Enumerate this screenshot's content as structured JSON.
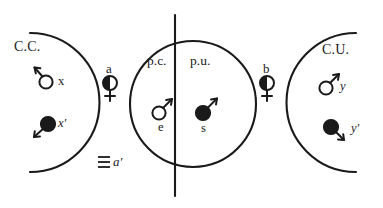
{
  "figure": {
    "background_color": "#ffffff",
    "ink_color": "#1a1a1a",
    "width": 383,
    "height": 208
  },
  "regions": {
    "left": {
      "name": "left-arc-region",
      "label": "C.C.",
      "shape": "open-arc-opening-left",
      "markers": [
        {
          "id": "x",
          "label": "x",
          "symbol": "mars-open",
          "fill": "open",
          "arrow_direction": "up-left"
        },
        {
          "id": "xp",
          "label": "x′",
          "symbol": "filled-disc-arrow",
          "fill": "filled",
          "arrow_direction": "down-left"
        }
      ]
    },
    "center": {
      "name": "center-circle-region",
      "shape": "full-circle-split-by-vertical-line",
      "left_half_label": "p.c.",
      "right_half_label": "p.u.",
      "markers": [
        {
          "id": "e",
          "label": "e",
          "symbol": "mars-open",
          "fill": "open",
          "arrow_direction": "up-right"
        },
        {
          "id": "s",
          "label": "s",
          "symbol": "mars-filled",
          "fill": "filled",
          "arrow_direction": "up-right"
        }
      ]
    },
    "right": {
      "name": "right-arc-region",
      "label": "C.U.",
      "shape": "open-arc-opening-right",
      "markers": [
        {
          "id": "y",
          "label": "y",
          "symbol": "mars-open",
          "fill": "open",
          "arrow_direction": "up-right"
        },
        {
          "id": "yp",
          "label": "y′",
          "symbol": "filled-disc-arrow",
          "fill": "filled",
          "arrow_direction": "down-right"
        }
      ]
    }
  },
  "boundary_tags": [
    {
      "id": "a",
      "label": "a",
      "symbol": "venus-half-filled",
      "position": "between-left-arc-and-center-circle"
    },
    {
      "id": "b",
      "label": "b",
      "symbol": "venus-half-filled",
      "position": "between-center-circle-and-right-arc"
    },
    {
      "id": "ap",
      "label": "a′",
      "symbol": "triple-bar",
      "position": "below-left-gap"
    }
  ],
  "glyphs": {
    "triple_bar": "≡",
    "prime": "′"
  }
}
